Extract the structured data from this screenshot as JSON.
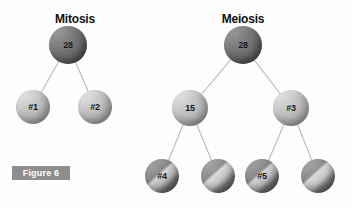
{
  "figure": {
    "badge_label": "Figure 6",
    "background_color": "#fdfdfd",
    "badge_bg_color": "#8e8e8e",
    "badge_text_color": "#ffffff",
    "edge_color": "#b9b9b9"
  },
  "diagrams": [
    {
      "id": "mitosis",
      "title": "Mitosis",
      "title_x": 75,
      "title_y": 12,
      "nodes": [
        {
          "id": "m-root",
          "label": "28",
          "x": 68,
          "y": 45,
          "r": 19,
          "style": "dark",
          "font_size": 9
        },
        {
          "id": "m-c1",
          "label": "#1",
          "x": 33,
          "y": 107,
          "r": 17,
          "style": "light",
          "font_size": 9
        },
        {
          "id": "m-c2",
          "label": "#2",
          "x": 95,
          "y": 107,
          "r": 17,
          "style": "light",
          "font_size": 9
        }
      ],
      "edges": [
        {
          "from": "m-root",
          "to": "m-c1"
        },
        {
          "from": "m-root",
          "to": "m-c2"
        }
      ]
    },
    {
      "id": "meiosis",
      "title": "Meiosis",
      "title_x": 243,
      "title_y": 12,
      "nodes": [
        {
          "id": "x-root",
          "label": "28",
          "x": 243,
          "y": 45,
          "r": 19,
          "style": "dark",
          "font_size": 9
        },
        {
          "id": "x-m1",
          "label": "15",
          "x": 190,
          "y": 108,
          "r": 18,
          "style": "light",
          "font_size": 9
        },
        {
          "id": "x-m2",
          "label": "#3",
          "x": 291,
          "y": 108,
          "r": 18,
          "style": "light",
          "font_size": 9
        },
        {
          "id": "x-b1",
          "label": "#4",
          "x": 162,
          "y": 176,
          "r": 17,
          "style": "split",
          "font_size": 9
        },
        {
          "id": "x-b2",
          "label": "",
          "x": 218,
          "y": 176,
          "r": 17,
          "style": "split",
          "font_size": 9
        },
        {
          "id": "x-b3",
          "label": "#5",
          "x": 262,
          "y": 176,
          "r": 17,
          "style": "split",
          "font_size": 9
        },
        {
          "id": "x-b4",
          "label": "",
          "x": 318,
          "y": 176,
          "r": 17,
          "style": "split",
          "font_size": 9
        }
      ],
      "edges": [
        {
          "from": "x-root",
          "to": "x-m1"
        },
        {
          "from": "x-root",
          "to": "x-m2"
        },
        {
          "from": "x-m1",
          "to": "x-b1"
        },
        {
          "from": "x-m1",
          "to": "x-b2"
        },
        {
          "from": "x-m2",
          "to": "x-b3"
        },
        {
          "from": "x-m2",
          "to": "x-b4"
        }
      ]
    }
  ],
  "badge": {
    "x": 12,
    "y": 166,
    "w": 58,
    "h": 14,
    "font_size": 9
  },
  "titles_font_size": 12
}
